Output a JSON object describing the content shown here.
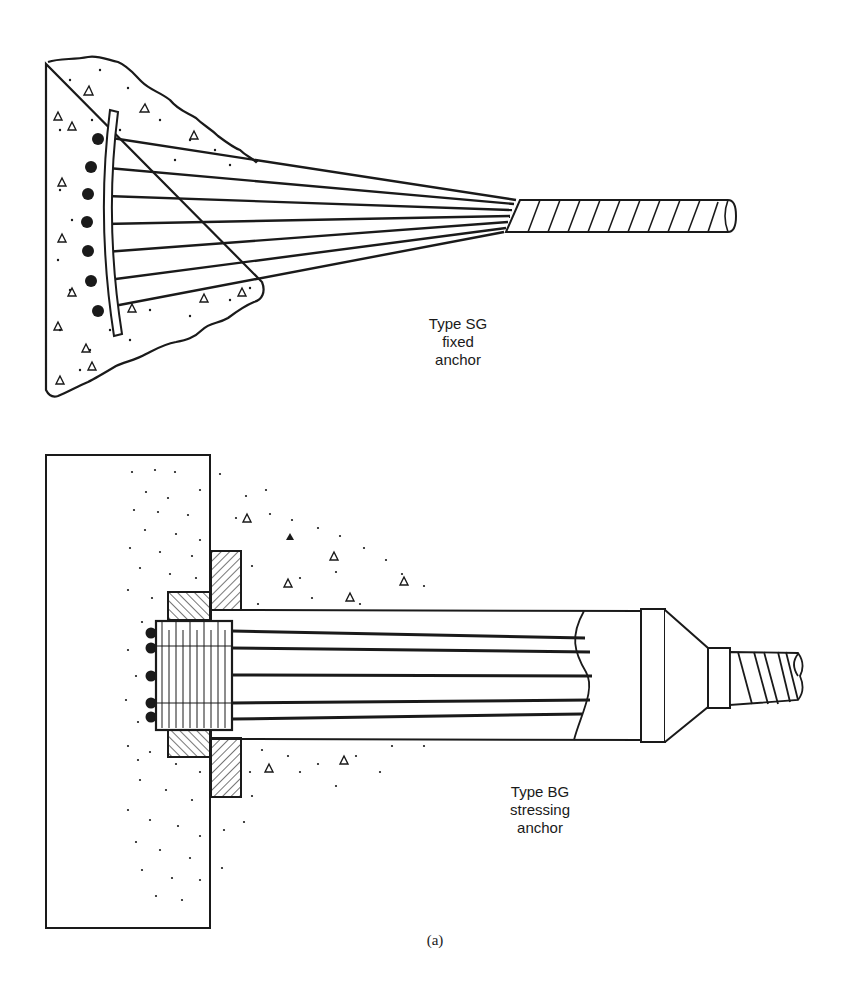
{
  "figure": {
    "caption": "(a)",
    "colors": {
      "ink": "#1a1a1a",
      "background": "#ffffff"
    }
  },
  "fixed_anchor": {
    "label_line1": "Type SG",
    "label_line2": "fixed",
    "label_line3": "anchor",
    "strand_count": 7,
    "components": [
      "concrete-mass",
      "bearing-plate",
      "strand-fan",
      "sheathed-tendon"
    ]
  },
  "stressing_anchor": {
    "label_line1": "Type BG",
    "label_line2": "stressing",
    "label_line3": "anchor",
    "strand_count": 5,
    "components": [
      "concrete-wall",
      "anchor-head",
      "bearing-plate",
      "trumpet-tube",
      "transition-cone",
      "corrugated-duct"
    ]
  }
}
